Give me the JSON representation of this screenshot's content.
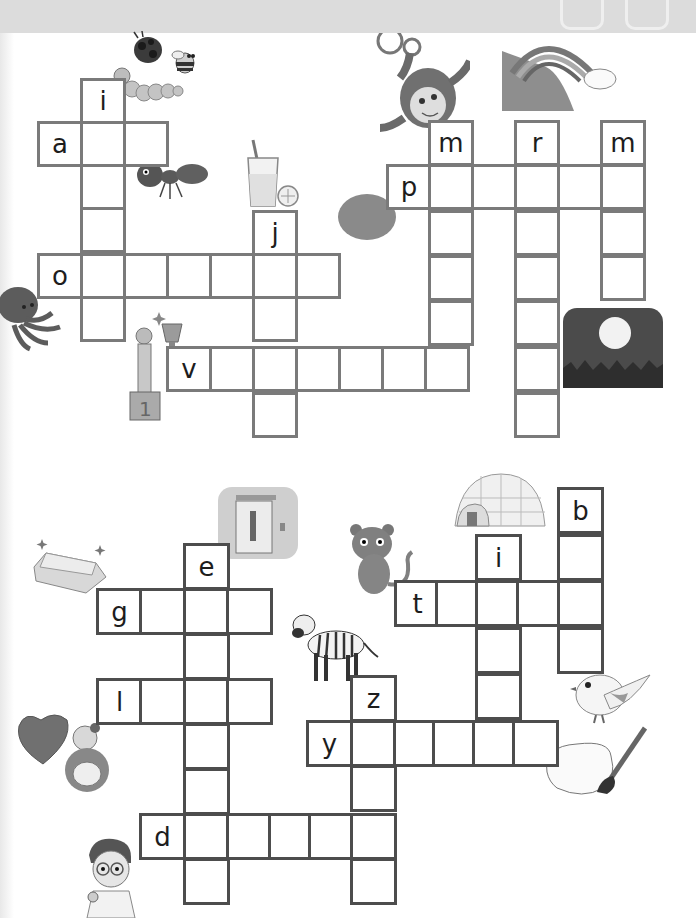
{
  "colors": {
    "header_band": "#dcdcdc",
    "grid_top": "#7a7a7a",
    "grid_bottom": "#4d4d4d",
    "letter": "#1d1d1d"
  },
  "top_puzzle": {
    "cell_size": 43,
    "cells": [
      {
        "x": 80,
        "y": 78,
        "letter": "i"
      },
      {
        "x": 37,
        "y": 121,
        "letter": "a"
      },
      {
        "x": 80,
        "y": 121,
        "letter": ""
      },
      {
        "x": 123,
        "y": 121,
        "letter": ""
      },
      {
        "x": 80,
        "y": 164,
        "letter": ""
      },
      {
        "x": 80,
        "y": 207,
        "letter": ""
      },
      {
        "x": 37,
        "y": 253,
        "letter": "o"
      },
      {
        "x": 80,
        "y": 253,
        "letter": ""
      },
      {
        "x": 123,
        "y": 253,
        "letter": ""
      },
      {
        "x": 166,
        "y": 253,
        "letter": ""
      },
      {
        "x": 209,
        "y": 253,
        "letter": ""
      },
      {
        "x": 252,
        "y": 253,
        "letter": ""
      },
      {
        "x": 295,
        "y": 253,
        "letter": ""
      },
      {
        "x": 80,
        "y": 296,
        "letter": ""
      },
      {
        "x": 252,
        "y": 210,
        "letter": "j"
      },
      {
        "x": 252,
        "y": 296,
        "letter": ""
      },
      {
        "x": 252,
        "y": 346,
        "letter": ""
      },
      {
        "x": 252,
        "y": 392,
        "letter": ""
      },
      {
        "x": 166,
        "y": 346,
        "letter": "v"
      },
      {
        "x": 209,
        "y": 346,
        "letter": ""
      },
      {
        "x": 295,
        "y": 346,
        "letter": ""
      },
      {
        "x": 338,
        "y": 346,
        "letter": ""
      },
      {
        "x": 381,
        "y": 346,
        "letter": ""
      },
      {
        "x": 424,
        "y": 346,
        "letter": ""
      },
      {
        "x": 428,
        "y": 120,
        "letter": "m"
      },
      {
        "x": 386,
        "y": 164,
        "letter": "p"
      },
      {
        "x": 428,
        "y": 164,
        "letter": ""
      },
      {
        "x": 471,
        "y": 164,
        "letter": ""
      },
      {
        "x": 514,
        "y": 164,
        "letter": ""
      },
      {
        "x": 557,
        "y": 164,
        "letter": ""
      },
      {
        "x": 600,
        "y": 164,
        "letter": ""
      },
      {
        "x": 428,
        "y": 210,
        "letter": ""
      },
      {
        "x": 428,
        "y": 255,
        "letter": ""
      },
      {
        "x": 428,
        "y": 300,
        "letter": ""
      },
      {
        "x": 514,
        "y": 120,
        "letter": "r"
      },
      {
        "x": 514,
        "y": 210,
        "letter": ""
      },
      {
        "x": 514,
        "y": 255,
        "letter": ""
      },
      {
        "x": 514,
        "y": 300,
        "letter": ""
      },
      {
        "x": 514,
        "y": 346,
        "letter": ""
      },
      {
        "x": 514,
        "y": 392,
        "letter": ""
      },
      {
        "x": 600,
        "y": 120,
        "letter": "m"
      },
      {
        "x": 600,
        "y": 210,
        "letter": ""
      },
      {
        "x": 600,
        "y": 255,
        "letter": ""
      }
    ]
  },
  "bottom_puzzle": {
    "cell_size": 44,
    "cells": [
      {
        "x": 183,
        "y": 543,
        "letter": "e"
      },
      {
        "x": 96,
        "y": 588,
        "letter": "g"
      },
      {
        "x": 139,
        "y": 588,
        "letter": ""
      },
      {
        "x": 183,
        "y": 588,
        "letter": ""
      },
      {
        "x": 226,
        "y": 588,
        "letter": ""
      },
      {
        "x": 183,
        "y": 633,
        "letter": ""
      },
      {
        "x": 96,
        "y": 678,
        "letter": "l"
      },
      {
        "x": 139,
        "y": 678,
        "letter": ""
      },
      {
        "x": 183,
        "y": 678,
        "letter": ""
      },
      {
        "x": 226,
        "y": 678,
        "letter": ""
      },
      {
        "x": 183,
        "y": 723,
        "letter": ""
      },
      {
        "x": 183,
        "y": 768,
        "letter": ""
      },
      {
        "x": 139,
        "y": 813,
        "letter": "d"
      },
      {
        "x": 183,
        "y": 813,
        "letter": ""
      },
      {
        "x": 226,
        "y": 813,
        "letter": ""
      },
      {
        "x": 268,
        "y": 813,
        "letter": ""
      },
      {
        "x": 308,
        "y": 813,
        "letter": ""
      },
      {
        "x": 350,
        "y": 813,
        "letter": ""
      },
      {
        "x": 183,
        "y": 858,
        "letter": ""
      },
      {
        "x": 350,
        "y": 858,
        "letter": ""
      },
      {
        "x": 350,
        "y": 675,
        "letter": "z"
      },
      {
        "x": 306,
        "y": 720,
        "letter": "y"
      },
      {
        "x": 350,
        "y": 720,
        "letter": ""
      },
      {
        "x": 393,
        "y": 720,
        "letter": ""
      },
      {
        "x": 432,
        "y": 720,
        "letter": ""
      },
      {
        "x": 472,
        "y": 720,
        "letter": ""
      },
      {
        "x": 512,
        "y": 720,
        "letter": ""
      },
      {
        "x": 350,
        "y": 765,
        "letter": ""
      },
      {
        "x": 475,
        "y": 534,
        "letter": "i"
      },
      {
        "x": 394,
        "y": 580,
        "letter": "t"
      },
      {
        "x": 435,
        "y": 580,
        "letter": ""
      },
      {
        "x": 475,
        "y": 580,
        "letter": ""
      },
      {
        "x": 516,
        "y": 580,
        "letter": ""
      },
      {
        "x": 557,
        "y": 580,
        "letter": ""
      },
      {
        "x": 475,
        "y": 627,
        "letter": ""
      },
      {
        "x": 475,
        "y": 673,
        "letter": ""
      },
      {
        "x": 557,
        "y": 487,
        "letter": "b"
      },
      {
        "x": 557,
        "y": 534,
        "letter": ""
      },
      {
        "x": 557,
        "y": 627,
        "letter": ""
      }
    ]
  },
  "pictures": [
    {
      "name": "ladybug",
      "x": 128,
      "y": 30
    },
    {
      "name": "bee",
      "x": 170,
      "y": 45
    },
    {
      "name": "caterpillar",
      "x": 115,
      "y": 65
    },
    {
      "name": "ant",
      "x": 135,
      "y": 155
    },
    {
      "name": "juice-glass",
      "x": 248,
      "y": 140
    },
    {
      "name": "monkey",
      "x": 362,
      "y": 33
    },
    {
      "name": "rainbow",
      "x": 502,
      "y": 33
    },
    {
      "name": "potato",
      "x": 338,
      "y": 195
    },
    {
      "name": "octopus",
      "x": 0,
      "y": 285
    },
    {
      "name": "trophy-winner",
      "x": 128,
      "y": 308
    },
    {
      "name": "night-moon",
      "x": 563,
      "y": 308
    },
    {
      "name": "elevator",
      "x": 218,
      "y": 487
    },
    {
      "name": "igloo",
      "x": 443,
      "y": 470
    },
    {
      "name": "gold-bar",
      "x": 33,
      "y": 538
    },
    {
      "name": "tiger",
      "x": 350,
      "y": 524
    },
    {
      "name": "zebra",
      "x": 292,
      "y": 605
    },
    {
      "name": "bird",
      "x": 571,
      "y": 668
    },
    {
      "name": "love-mother",
      "x": 17,
      "y": 712
    },
    {
      "name": "paint-palette",
      "x": 543,
      "y": 720
    },
    {
      "name": "doctor",
      "x": 85,
      "y": 835
    }
  ]
}
